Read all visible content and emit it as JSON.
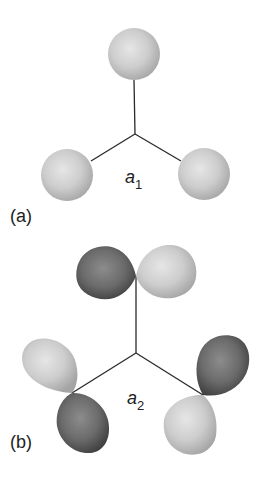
{
  "panels": [
    {
      "id": "a",
      "label": "(a)",
      "symmetry_label": "a",
      "symmetry_subscript": "1",
      "description": "three s-like spheres on trigonal arms",
      "center": [
        135,
        134
      ],
      "orbitals": [
        {
          "type": "sphere",
          "cx": 134,
          "cy": 54,
          "r": 26,
          "phase": "light"
        },
        {
          "type": "sphere",
          "cx": 67,
          "cy": 175,
          "r": 26,
          "phase": "light"
        },
        {
          "type": "sphere",
          "cx": 204,
          "cy": 174,
          "r": 26,
          "phase": "light"
        }
      ]
    },
    {
      "id": "b",
      "label": "(b)",
      "symmetry_label": "a",
      "symmetry_subscript": "2",
      "description": "three tangential p-orbitals on trigonal arms",
      "center": [
        136,
        353
      ]
    }
  ],
  "colors": {
    "light_lobe": "#cfcfcf",
    "light_lobe_highlight": "#e4e4e4",
    "light_lobe_edge": "#a8a8a8",
    "dark_lobe": "#6e6e6e",
    "dark_lobe_highlight": "#8a8a8a",
    "dark_lobe_edge": "#3e3e3e",
    "bond": "#2a2a2a"
  }
}
